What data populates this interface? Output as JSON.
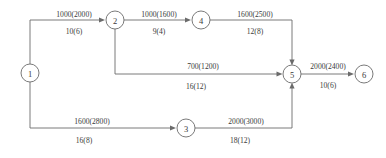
{
  "diagram": {
    "type": "directed-network",
    "stroke_color": "#6b6b6b",
    "text_color": "#3a3a3a",
    "background": "#ffffff",
    "nodes": [
      {
        "id": "1",
        "label": "1",
        "cx": 30,
        "cy": 73,
        "r": 9
      },
      {
        "id": "2",
        "label": "2",
        "cx": 115,
        "cy": 20,
        "r": 9
      },
      {
        "id": "3",
        "label": "3",
        "cx": 186,
        "cy": 128,
        "r": 9
      },
      {
        "id": "4",
        "label": "4",
        "cx": 201,
        "cy": 20,
        "r": 9
      },
      {
        "id": "5",
        "label": "5",
        "cx": 292,
        "cy": 74,
        "r": 9
      },
      {
        "id": "6",
        "label": "6",
        "cx": 364,
        "cy": 74,
        "r": 9
      }
    ],
    "edges": [
      {
        "id": "e1-2",
        "from": "1",
        "to": "2",
        "capacity_label": "1000(2000)",
        "cost_label": "10(6)",
        "capacity_pos": {
          "x": 74,
          "y": 14
        },
        "cost_pos": {
          "x": 74,
          "y": 31
        }
      },
      {
        "id": "e2-4",
        "from": "2",
        "to": "4",
        "capacity_label": "1000(1600)",
        "cost_label": "9(4)",
        "capacity_pos": {
          "x": 159,
          "y": 14
        },
        "cost_pos": {
          "x": 159,
          "y": 31
        }
      },
      {
        "id": "e4-5",
        "from": "4",
        "to": "5",
        "capacity_label": "1600(2500)",
        "cost_label": "12(8)",
        "capacity_pos": {
          "x": 255,
          "y": 14
        },
        "cost_pos": {
          "x": 255,
          "y": 31
        }
      },
      {
        "id": "e2-5",
        "from": "2",
        "to": "5",
        "capacity_label": "700(1200)",
        "cost_label": "16(12)",
        "capacity_pos": {
          "x": 203,
          "y": 66
        },
        "cost_pos": {
          "x": 196,
          "y": 86
        }
      },
      {
        "id": "e5-6",
        "from": "5",
        "to": "6",
        "capacity_label": "2000(2400)",
        "cost_label": "10(6)",
        "capacity_pos": {
          "x": 328,
          "y": 66
        },
        "cost_pos": {
          "x": 328,
          "y": 85
        }
      },
      {
        "id": "e1-3",
        "from": "1",
        "to": "3",
        "capacity_label": "1600(2800)",
        "cost_label": "16(8)",
        "capacity_pos": {
          "x": 92,
          "y": 121
        },
        "cost_pos": {
          "x": 84,
          "y": 140
        }
      },
      {
        "id": "e3-5",
        "from": "3",
        "to": "5",
        "capacity_label": "2000(3000)",
        "cost_label": "18(12)",
        "capacity_pos": {
          "x": 246,
          "y": 121
        },
        "cost_pos": {
          "x": 240,
          "y": 140
        }
      }
    ],
    "paths": {
      "e1-2": "M 30 64 L 30 20 L 101 20",
      "e2-4": "M 124 20 L 187 20",
      "e4-5": "M 210 20 L 292 20 L 292 61",
      "e2-5": "M 115 29 L 115 74 L 278 74",
      "e5-6": "M 301 74 L 350 74",
      "e1-3": "M 30 82 L 30 128 L 172 128",
      "e3-5": "M 195 128 L 292 128 L 292 87"
    },
    "arrows": [
      {
        "id": "arrow-into-2",
        "x": 105,
        "y": 20,
        "dir": "right"
      },
      {
        "id": "arrow-into-4",
        "x": 191,
        "y": 20,
        "dir": "right"
      },
      {
        "id": "arrow-into-5-top",
        "x": 292,
        "y": 65,
        "dir": "down"
      },
      {
        "id": "arrow-into-5-left",
        "x": 282,
        "y": 74,
        "dir": "right"
      },
      {
        "id": "arrow-into-5-bottom",
        "x": 292,
        "y": 83,
        "dir": "up"
      },
      {
        "id": "arrow-into-6",
        "x": 354,
        "y": 74,
        "dir": "right"
      },
      {
        "id": "arrow-into-3",
        "x": 176,
        "y": 128,
        "dir": "right"
      }
    ]
  }
}
